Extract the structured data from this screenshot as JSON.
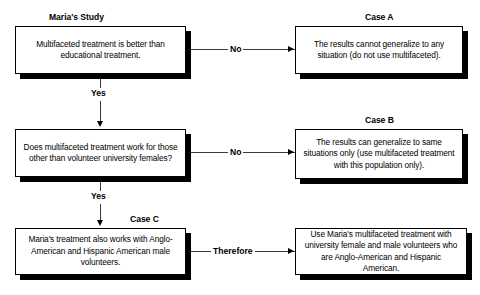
{
  "diagram": {
    "title_maria_study": "Maria's Study",
    "title_case_a": "Case A",
    "title_case_b": "Case B",
    "title_case_c": "Case C",
    "nodes": {
      "question1": "Multifaceted treatment is better than educational treatment.",
      "outcome_a": "The results cannot generalize to any situation (do not use multifaceted).",
      "question2": "Does multifaceted treatment work for those other than volunteer university females?",
      "outcome_b": "The results can generalize to same situations only (use multifaceted treatment with this population only).",
      "finding_c": "Maria's treatment also works with Anglo-American and Hispanic American male volunteers.",
      "conclusion": "Use Maria's multifaceted treatment with university female and male volunteers who are Anglo-American and Hispanic American."
    },
    "edges": {
      "no_1": "No",
      "no_2": "No",
      "yes_1": "Yes",
      "yes_2": "Yes",
      "therefore": "Therefore"
    },
    "colors": {
      "ink": "#000000",
      "line": "#3a3a3a",
      "paper": "#ffffff"
    }
  }
}
